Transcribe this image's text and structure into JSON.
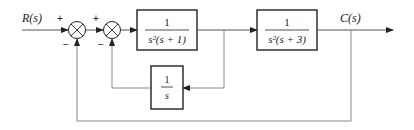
{
  "diagram": {
    "type": "block-diagram",
    "input_label": "R(s)",
    "output_label": "C(s)",
    "summing_junctions": [
      {
        "id": "sum1",
        "signs": {
          "top": "+",
          "bottom": "−"
        }
      },
      {
        "id": "sum2",
        "signs": {
          "top": "+",
          "bottom": "−"
        }
      }
    ],
    "blocks": [
      {
        "id": "G1",
        "numerator": "1",
        "denominator": "s²(s + 1)"
      },
      {
        "id": "G2",
        "numerator": "1",
        "denominator": "s²(s + 3)"
      },
      {
        "id": "H1",
        "numerator": "1",
        "denominator": "s"
      }
    ],
    "connections": [
      "R(s) → sum1 (+)",
      "sum1 → sum2 (+)",
      "sum2 → G1",
      "G1 → G2",
      "G2 → C(s)",
      "G1 output → H1 → sum2 (−)",
      "C(s) → sum1 (−)"
    ],
    "colors": {
      "line": "#333333",
      "feedback_line": "#888888"
    }
  }
}
